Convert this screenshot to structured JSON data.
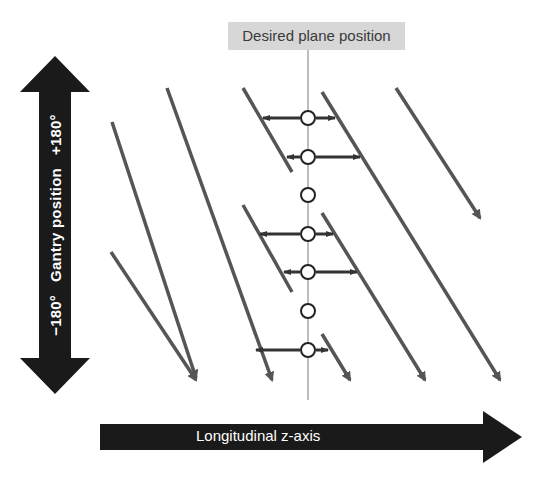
{
  "title": "Desired plane position",
  "vertical_axis": {
    "label": "Gantry position",
    "min_label": "−180°",
    "max_label": "+180°"
  },
  "horizontal_axis": {
    "label": "Longitudinal z-axis"
  },
  "colors": {
    "arrow_fill": "#1a1a1a",
    "diagonal": "#555555",
    "guide_line": "#bdbdbd",
    "label_bg": "#d7d7d7",
    "interp_arrow": "#333333"
  },
  "diagonals": [
    {
      "x1": 112,
      "y1": 122,
      "x2": 196,
      "y2": 378,
      "arrow": true
    },
    {
      "x1": 111,
      "y1": 252,
      "x2": 196,
      "y2": 380,
      "arrow": true
    },
    {
      "x1": 167,
      "y1": 88,
      "x2": 272,
      "y2": 380,
      "arrow": true
    },
    {
      "x1": 243,
      "y1": 88,
      "x2": 292,
      "y2": 172,
      "arrow": false
    },
    {
      "x1": 243,
      "y1": 205,
      "x2": 292,
      "y2": 292,
      "arrow": false
    },
    {
      "x1": 322,
      "y1": 92,
      "x2": 500,
      "y2": 380,
      "arrow": true
    },
    {
      "x1": 396,
      "y1": 88,
      "x2": 480,
      "y2": 218,
      "arrow": true
    },
    {
      "x1": 322,
      "y1": 213,
      "x2": 425,
      "y2": 380,
      "arrow": true
    },
    {
      "x1": 322,
      "y1": 334,
      "x2": 350,
      "y2": 380,
      "arrow": true
    }
  ],
  "sample_points": [
    {
      "y": 118,
      "left": 263,
      "right": 335
    },
    {
      "y": 157,
      "left": 287,
      "right": 360
    },
    {
      "y": 195
    },
    {
      "y": 234,
      "left": 260,
      "right": 333
    },
    {
      "y": 272,
      "left": 284,
      "right": 357
    },
    {
      "y": 311
    },
    {
      "y": 350,
      "left": 256,
      "right": 328
    }
  ]
}
